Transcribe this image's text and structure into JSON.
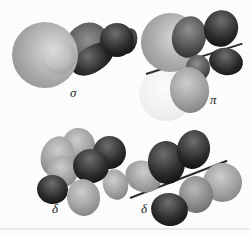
{
  "labels": {
    "sigma": "σ",
    "pi": "π",
    "delta_left": "δ",
    "delta_right": "δ"
  },
  "colors": {
    "bg": "#fcfcfc",
    "sphere-hi": "#dcdcdc",
    "sphere-mid": "#a8a8a8",
    "sphere-dk": "#898989",
    "dark-hi": "#6e6e6e",
    "dark-mid": "#2a2a2a",
    "dark-dk": "#070707",
    "dgray-hi": "#909090",
    "dgray-mid": "#4d4d4d",
    "dgray-dk": "#262626",
    "mid-hi": "#cdcdcd",
    "mid-mid": "#999999",
    "mid-dk": "#757575",
    "mid2-hi": "#b8b8b8",
    "mid2-mid": "#828282",
    "mid2-dk": "#5e5e5e",
    "light-hi": "#fbfbfb",
    "light-mid": "#efefef",
    "light-dk": "#dddddd",
    "line": "#2e2e2e",
    "label": "#1b1b1b",
    "rule": "#eaeaea"
  }
}
